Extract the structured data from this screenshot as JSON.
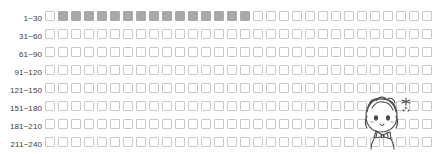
{
  "tracker": {
    "type": "habit-grid",
    "columns_per_row": 30,
    "total_cells": 283,
    "filled_count": 15,
    "colors": {
      "cell_empty_border": "#c8c8c8",
      "cell_empty_fill": "#ffffff",
      "cell_filled": "#a8a8a8",
      "label_text": "#3b3b3b",
      "background": "#ffffff"
    },
    "rows": [
      {
        "label": "1~30",
        "cells": 30,
        "filled": [
          2,
          3,
          4,
          5,
          6,
          7,
          8,
          9,
          10,
          11,
          12,
          13,
          14,
          15,
          16
        ]
      },
      {
        "label": "31~60",
        "cells": 30,
        "filled": []
      },
      {
        "label": "61~90",
        "cells": 30,
        "filled": []
      },
      {
        "label": "91~120",
        "cells": 30,
        "filled": []
      },
      {
        "label": "121~150",
        "cells": 30,
        "filled": []
      },
      {
        "label": "151~180",
        "cells": 30,
        "filled": []
      },
      {
        "label": "181~210",
        "cells": 30,
        "filled": []
      },
      {
        "label": "211~240",
        "cells": 30,
        "filled": []
      },
      {
        "label": "241~270",
        "cells": 30,
        "filled": []
      },
      {
        "label": "271~283",
        "cells": 13,
        "filled": []
      }
    ]
  },
  "doodle": {
    "name": "chibi-girl-sparkle-doodle",
    "description": "hand-drawn chibi character with bow tie and sparkle"
  }
}
